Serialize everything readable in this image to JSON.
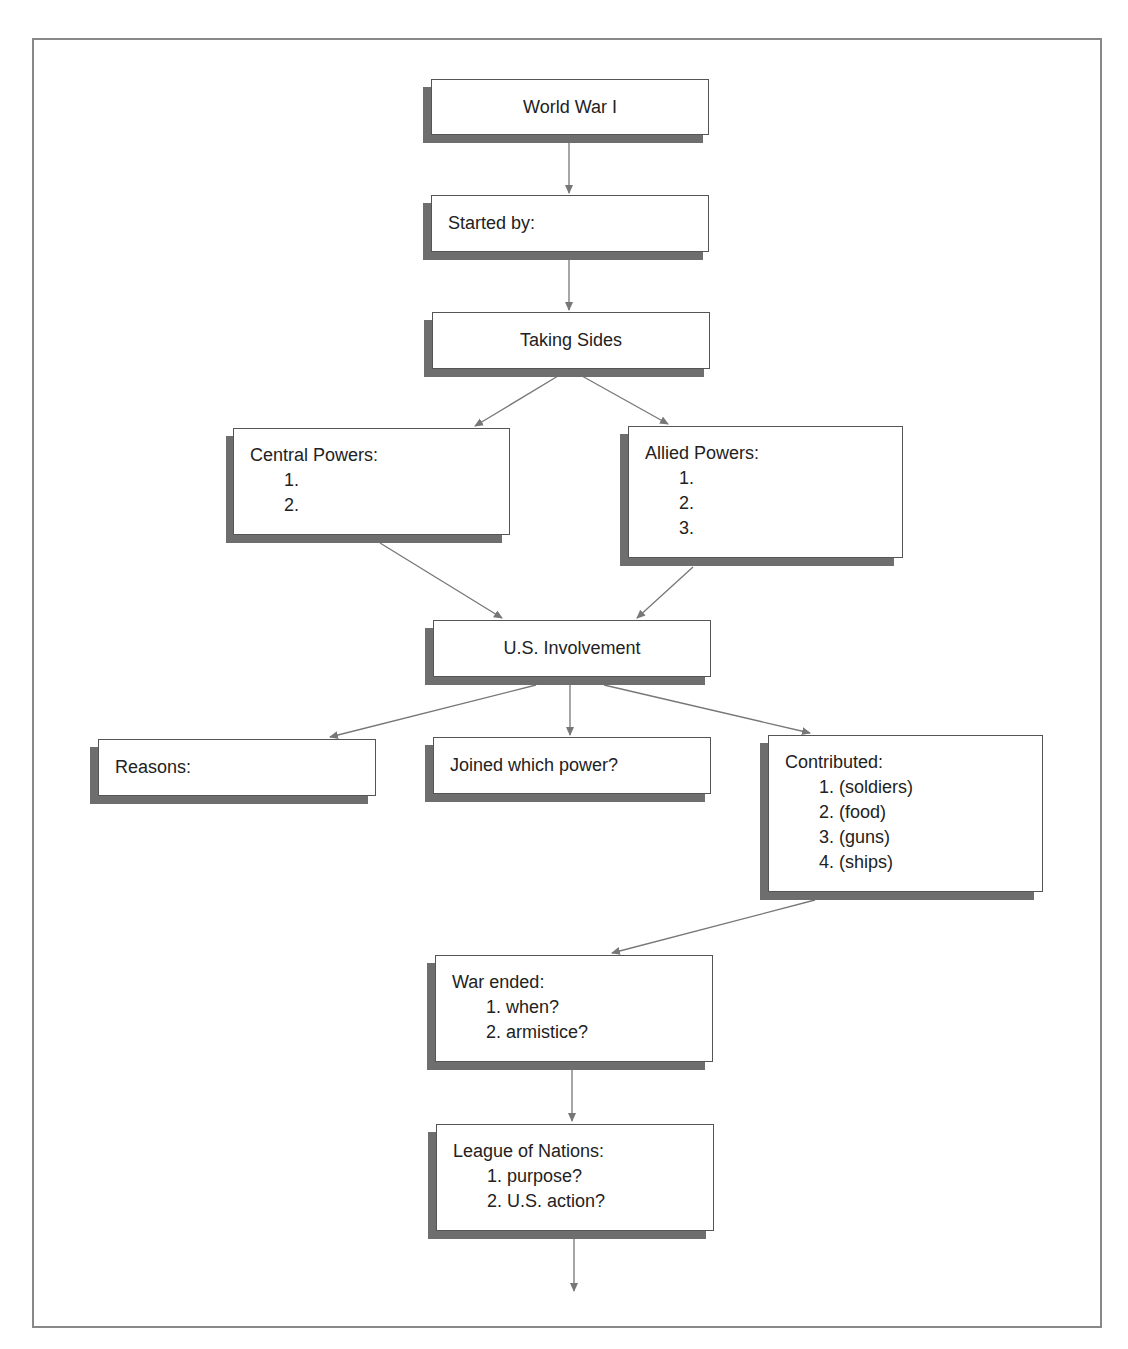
{
  "diagram": {
    "title": "World War I",
    "nodes": {
      "world_war": {
        "label": "World War I"
      },
      "started_by": {
        "label": "Started by:"
      },
      "taking_sides": {
        "label": "Taking Sides"
      },
      "central_powers": {
        "label": "Central Powers:",
        "items": [
          "1.",
          "2."
        ]
      },
      "allied_powers": {
        "label": "Allied Powers:",
        "items": [
          "1.",
          "2.",
          "3."
        ]
      },
      "us_involvement": {
        "label": "U.S. Involvement"
      },
      "reasons": {
        "label": "Reasons:"
      },
      "joined": {
        "label": "Joined which power?"
      },
      "contributed": {
        "label": "Contributed:",
        "items": [
          "1. (soldiers)",
          "2. (food)",
          "3. (guns)",
          "4. (ships)"
        ]
      },
      "war_ended": {
        "label": "War ended:",
        "items": [
          "1. when?",
          "2. armistice?"
        ]
      },
      "league": {
        "label": "League of Nations:",
        "items": [
          "1. purpose?",
          "2. U.S. action?"
        ]
      }
    },
    "edges": [
      [
        "world_war",
        "started_by"
      ],
      [
        "started_by",
        "taking_sides"
      ],
      [
        "taking_sides",
        "central_powers"
      ],
      [
        "taking_sides",
        "allied_powers"
      ],
      [
        "central_powers",
        "us_involvement"
      ],
      [
        "allied_powers",
        "us_involvement"
      ],
      [
        "us_involvement",
        "reasons"
      ],
      [
        "us_involvement",
        "joined"
      ],
      [
        "us_involvement",
        "contributed"
      ],
      [
        "contributed",
        "war_ended"
      ],
      [
        "war_ended",
        "league"
      ],
      [
        "league",
        "continues"
      ]
    ],
    "colors": {
      "box_border": "#555555",
      "shadow": "#6e6e6e",
      "arrow": "#777777",
      "frame": "#888888"
    }
  }
}
